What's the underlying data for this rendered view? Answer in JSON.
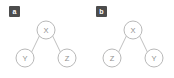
{
  "figure": {
    "background_color": "#ffffff",
    "node_stroke_color": "#b0b0b0",
    "edge_stroke_color": "#b9b9b9",
    "label_color": "#8f8f8f",
    "badge_background_color": "#4c4c4c",
    "badge_text_color": "#ffffff"
  },
  "panels": [
    {
      "badge": "a",
      "root": {
        "label": "X",
        "cx": 46,
        "cy": 30,
        "r": 9
      },
      "left_child": {
        "label": "Y",
        "cx": 25,
        "cy": 58,
        "r": 9
      },
      "right_child": {
        "label": "Z",
        "cx": 67,
        "cy": 58,
        "r": 9
      }
    },
    {
      "badge": "b",
      "root": {
        "label": "X",
        "cx": 46,
        "cy": 30,
        "r": 9
      },
      "left_child": {
        "label": "Z",
        "cx": 25,
        "cy": 58,
        "r": 9
      },
      "right_child": {
        "label": "Y",
        "cx": 67,
        "cy": 58,
        "r": 9
      }
    }
  ]
}
